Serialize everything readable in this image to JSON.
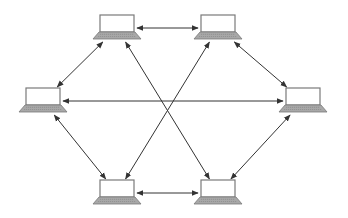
{
  "diagram": {
    "type": "network-topology",
    "layout": "hexagon-mesh",
    "colors": {
      "edge": "#333333",
      "laptop_outline": "#7a7a7a",
      "laptop_screen": "#ffffff",
      "laptop_base": "#a8a8a8",
      "laptop_keys": "#8a8a8a",
      "background": "#ffffff"
    },
    "nodes": [
      {
        "id": "top-left",
        "icon": "laptop-icon",
        "x": 117,
        "y": 28
      },
      {
        "id": "top-right",
        "icon": "laptop-icon",
        "x": 218,
        "y": 28
      },
      {
        "id": "left",
        "icon": "laptop-icon",
        "x": 43,
        "y": 101
      },
      {
        "id": "right",
        "icon": "laptop-icon",
        "x": 303,
        "y": 101
      },
      {
        "id": "bottom-left",
        "icon": "laptop-icon",
        "x": 117,
        "y": 193
      },
      {
        "id": "bottom-right",
        "icon": "laptop-icon",
        "x": 218,
        "y": 193
      }
    ],
    "edges": [
      {
        "from": "top-left",
        "to": "top-right",
        "arrows": "both"
      },
      {
        "from": "top-right",
        "to": "right",
        "arrows": "both"
      },
      {
        "from": "right",
        "to": "bottom-right",
        "arrows": "both"
      },
      {
        "from": "bottom-right",
        "to": "bottom-left",
        "arrows": "both"
      },
      {
        "from": "bottom-left",
        "to": "left",
        "arrows": "both"
      },
      {
        "from": "left",
        "to": "top-left",
        "arrows": "both"
      },
      {
        "from": "top-left",
        "to": "bottom-right",
        "arrows": "both"
      },
      {
        "from": "top-right",
        "to": "bottom-left",
        "arrows": "both"
      },
      {
        "from": "left",
        "to": "right",
        "arrows": "both"
      }
    ]
  }
}
